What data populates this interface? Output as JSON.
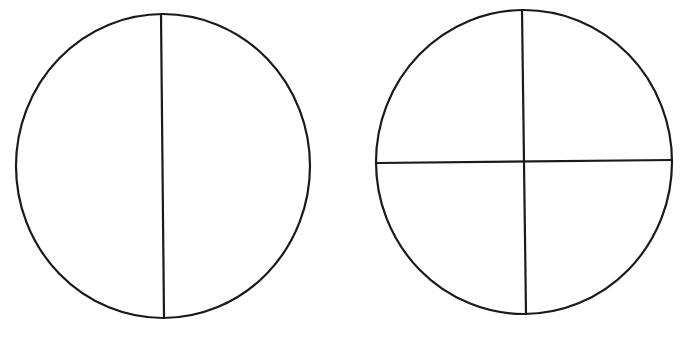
{
  "diagram": {
    "background": "#ffffff",
    "stroke_color": "#1a1a1a",
    "figures": [
      {
        "name": "circle-halves",
        "description": "Circle divided into 2 equal parts by a vertical line",
        "parts": 2,
        "ellipse": {
          "cx": 163,
          "cy": 166,
          "rx": 147,
          "ry": 152
        },
        "lines": [
          {
            "x1": 161,
            "y1": 14,
            "x2": 164,
            "y2": 318
          }
        ]
      },
      {
        "name": "circle-quarters",
        "description": "Circle divided into 4 equal parts by a vertical and a horizontal line",
        "parts": 4,
        "ellipse": {
          "cx": 524,
          "cy": 162,
          "rx": 148,
          "ry": 152
        },
        "lines": [
          {
            "x1": 522,
            "y1": 10,
            "x2": 526,
            "y2": 314
          },
          {
            "x1": 377,
            "y1": 163,
            "x2": 672,
            "y2": 160
          }
        ]
      }
    ]
  }
}
